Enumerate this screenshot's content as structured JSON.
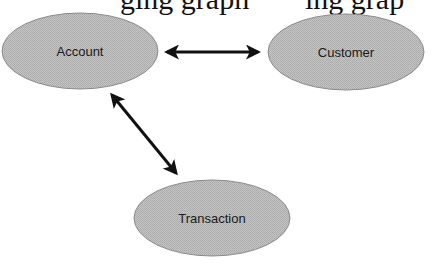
{
  "top_text": {
    "left_fragment": "ging graph",
    "right_fragment": "ing grap"
  },
  "colors": {
    "node_fill": "#b9b9b9",
    "node_stroke": "#8a8a8a",
    "edge": "#111111"
  },
  "nodes": [
    {
      "id": "account",
      "label": "Account",
      "cx": 80,
      "cy": 51,
      "rx": 78,
      "ry": 38
    },
    {
      "id": "customer",
      "label": "Customer",
      "cx": 346,
      "cy": 52,
      "rx": 78,
      "ry": 38
    },
    {
      "id": "transaction",
      "label": "Transaction",
      "cx": 212,
      "cy": 218,
      "rx": 78,
      "ry": 38
    }
  ],
  "edges": [
    {
      "from": "account",
      "to": "customer",
      "type": "bidirectional"
    },
    {
      "from": "account",
      "to": "transaction",
      "type": "bidirectional"
    }
  ]
}
